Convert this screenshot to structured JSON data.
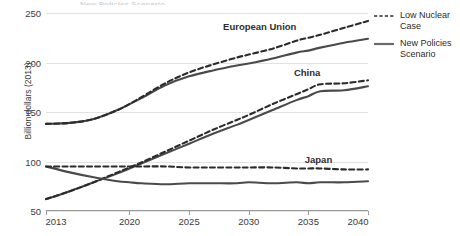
{
  "title": "New Policies Scenario",
  "axes": {
    "ylabel": "Billion dollars (2013)",
    "xlabel": "",
    "yticks": [
      "50",
      "100",
      "150",
      "200",
      "250"
    ],
    "xticks": [
      "2013",
      "2020",
      "2025",
      "2030",
      "2035",
      "2040"
    ]
  },
  "legend": {
    "items": [
      {
        "label": "Low Nuclear\nCase",
        "label_line1": "Low Nuclear",
        "label_line2": "Case",
        "style": "dashed",
        "color": "#3a3a3a"
      },
      {
        "label": "New Policies\nScenario",
        "label_line1": "New Policies",
        "label_line2": "Scenario",
        "style": "solid",
        "color": "#555555"
      }
    ]
  },
  "annotations": {
    "european_union": "European Union",
    "china": "China",
    "japan": "Japan"
  },
  "colors": {
    "solid_line": "#4a4a4a",
    "dashed_line": "#2b2b2b",
    "grid": "#e2e2e2",
    "axis": "#9b9b9b",
    "text": "#3b3b3b",
    "background": "#ffffff"
  },
  "chart_data": {
    "type": "line",
    "title": "New Policies Scenario",
    "xlabel": "",
    "ylabel": "Billion dollars (2013)",
    "xlim": [
      2013,
      2040
    ],
    "ylim": [
      50,
      250
    ],
    "grid": true,
    "legend_position": "right",
    "xticks": [
      2013,
      2020,
      2025,
      2030,
      2035,
      2040
    ],
    "yticks": [
      50,
      100,
      150,
      200,
      250
    ],
    "x": [
      2013,
      2015,
      2017,
      2019,
      2020,
      2021,
      2023,
      2025,
      2027,
      2029,
      2030,
      2032,
      2034,
      2035,
      2036,
      2038,
      2040
    ],
    "series": [
      {
        "name": "European Union - New Policies Scenario",
        "region": "European Union",
        "scenario": "New Policies Scenario",
        "style": "solid",
        "values": [
          138,
          139,
          143,
          152,
          158,
          164,
          177,
          186,
          192,
          197,
          199,
          204,
          210,
          212,
          215,
          220,
          224
        ]
      },
      {
        "name": "European Union - Low Nuclear Case",
        "region": "European Union",
        "scenario": "Low Nuclear Case",
        "style": "dashed",
        "values": [
          138,
          139,
          143,
          152,
          158,
          165,
          179,
          190,
          198,
          205,
          208,
          214,
          222,
          225,
          228,
          235,
          242
        ]
      },
      {
        "name": "China - New Policies Scenario",
        "region": "China",
        "scenario": "New Policies Scenario",
        "style": "solid",
        "values": [
          62,
          70,
          79,
          88,
          93,
          98,
          108,
          118,
          128,
          137,
          142,
          152,
          162,
          166,
          171,
          172,
          176
        ]
      },
      {
        "name": "China - Low Nuclear Case",
        "region": "China",
        "scenario": "Low Nuclear Case",
        "style": "dashed",
        "values": [
          62,
          70,
          79,
          89,
          94,
          99,
          110,
          121,
          132,
          142,
          147,
          158,
          168,
          173,
          178,
          179,
          182
        ]
      },
      {
        "name": "Japan - New Policies Scenario",
        "region": "Japan",
        "scenario": "New Policies Scenario",
        "style": "solid",
        "values": [
          95,
          89,
          84,
          80,
          79,
          78,
          77,
          78,
          78,
          78,
          79,
          78,
          79,
          78,
          79,
          79,
          80
        ]
      },
      {
        "name": "Japan - Low Nuclear Case",
        "region": "Japan",
        "scenario": "Low Nuclear Case",
        "style": "dashed",
        "values": [
          95,
          95,
          95,
          95,
          95,
          95,
          95,
          94,
          94,
          94,
          94,
          94,
          93,
          93,
          93,
          92,
          92
        ]
      }
    ],
    "annotations": [
      {
        "text": "European Union",
        "x": 2034,
        "y": 237
      },
      {
        "text": "China",
        "x": 2036,
        "y": 190
      },
      {
        "text": "Japan",
        "x": 2037,
        "y": 103
      }
    ]
  }
}
